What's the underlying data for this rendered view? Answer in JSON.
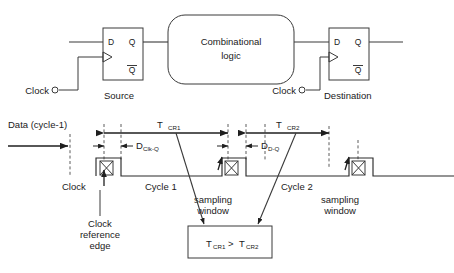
{
  "figure": {
    "background": "#ffffff",
    "line_color": "#3a3a3a",
    "text_color": "#1a1a1a"
  },
  "circuit": {
    "source_ff": {
      "name": "Source",
      "pin_d": "D",
      "pin_q": "Q",
      "pin_qbar": "Q",
      "clock_label": "Clock"
    },
    "comb_block": {
      "line1": "Combinational",
      "line2": "logic"
    },
    "dest_ff": {
      "name": "Destination",
      "pin_d": "D",
      "pin_q": "Q",
      "pin_qbar": "Q",
      "clock_label": "Clock"
    }
  },
  "timing": {
    "data_label": "Data (cycle-1)",
    "clock_label": "Clock",
    "clock_ref_edge": [
      "Clock",
      "reference",
      "edge"
    ],
    "cycle1_label": "Cycle 1",
    "cycle2_label": "Cycle 2",
    "sampling_window_1": [
      "sampling",
      "window"
    ],
    "sampling_window_2": [
      "sampling",
      "window"
    ],
    "t_cr1": {
      "base": "T",
      "sub": "CR1"
    },
    "t_cr2": {
      "base": "T",
      "sub": "CR2"
    },
    "d_clk_q": {
      "base": "D",
      "sub": "Clk-Q"
    },
    "d_d_q": {
      "base": "D",
      "sub": "D-Q"
    },
    "result_box": {
      "left": "T",
      "left_sub": "CR1",
      "op": ">",
      "right": "T",
      "right_sub": "CR2"
    }
  }
}
